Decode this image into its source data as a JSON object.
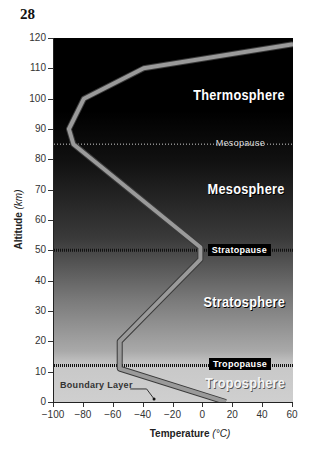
{
  "page_number": "28",
  "chart_data": {
    "type": "line",
    "title": "",
    "xlabel": "Temperature",
    "xlabel_unit": "(°C)",
    "ylabel": "Altitude",
    "ylabel_unit": "(km)",
    "xlim": [
      -100,
      60
    ],
    "ylim": [
      0,
      120
    ],
    "x_ticks": [
      -100,
      -80,
      -60,
      -40,
      -20,
      0,
      20,
      40,
      60
    ],
    "y_ticks": [
      0,
      10,
      20,
      30,
      40,
      50,
      60,
      70,
      80,
      90,
      100,
      110,
      120
    ],
    "grid": false,
    "series": [
      {
        "name": "Temperature profile",
        "points": [
          {
            "x": 15,
            "y": 0
          },
          {
            "x": -56,
            "y": 11
          },
          {
            "x": -56,
            "y": 20
          },
          {
            "x": -2,
            "y": 47
          },
          {
            "x": -2,
            "y": 51
          },
          {
            "x": -87,
            "y": 85
          },
          {
            "x": -90,
            "y": 90
          },
          {
            "x": -80,
            "y": 100
          },
          {
            "x": -40,
            "y": 110
          },
          {
            "x": 60,
            "y": 118
          }
        ]
      }
    ],
    "layers": [
      {
        "name": "Thermosphere",
        "label_altitude": 100
      },
      {
        "name": "Mesosphere",
        "label_altitude": 69
      },
      {
        "name": "Stratosphere",
        "label_altitude": 32
      },
      {
        "name": "Troposphere",
        "label_altitude": 5
      }
    ],
    "boundaries": [
      {
        "name": "Mesopause",
        "altitude": 85
      },
      {
        "name": "Stratopause",
        "altitude": 50
      },
      {
        "name": "Tropopause",
        "altitude": 12
      }
    ],
    "annotations": [
      {
        "text": "Boundary Layer",
        "x": -33,
        "y": 3
      }
    ]
  },
  "labels": {
    "thermosphere": "Thermosphere",
    "mesosphere": "Mesosphere",
    "stratosphere": "Stratosphere",
    "troposphere": "Troposphere",
    "mesopause": "Mesopause",
    "stratopause": "Stratopause",
    "tropopause": "Tropopause",
    "boundary_layer": "Boundary Layer",
    "x_axis": "Temperature",
    "x_unit": "(°C)",
    "y_axis": "Altitude",
    "y_unit": "(km)"
  },
  "colors": {
    "curve": "#9a9a9a",
    "curve_outline": "#3a3a3a",
    "boundary_dots": "#111111"
  }
}
